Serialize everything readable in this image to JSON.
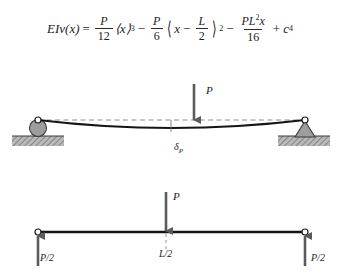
{
  "figure": {
    "colors": {
      "line": "#1c1c1c",
      "dashed_reference": "#8a8a8a",
      "support_fill": "#9a9a9a",
      "ground_hatch": "#8d8d8d",
      "arrow": "#555555",
      "background": "#ffffff"
    }
  },
  "equation": {
    "lhs": "EIv(x)",
    "equals": "=",
    "term1": {
      "numerator": "P",
      "denominator": "12",
      "bracket": "⟨x⟩",
      "exponent": "3"
    },
    "op1": "−",
    "term2": {
      "numerator": "P",
      "denominator": "6",
      "bracket_open": "⟨",
      "inner_var": "x",
      "inner_op": "−",
      "inner_num": "L",
      "inner_den": "2",
      "bracket_close": "⟩",
      "exponent": "2"
    },
    "op2": "−",
    "term3": {
      "numerator": "PL",
      "numerator_exp": "2",
      "numerator_var": "x",
      "denominator": "16"
    },
    "op3": "+",
    "term4": {
      "symbol": "c",
      "subscript": "4"
    },
    "plain_text": "EIv(x) = P/12 ⟨x⟩³ − P/6 ⟨x − L/2⟩² − PL²x/16 + c₄"
  },
  "deflected_beam": {
    "caption": "Deflected shape of simply supported beam",
    "load_label": "P",
    "deflection_symbol": "δ",
    "deflection_subscript": "P",
    "left_support": "roller",
    "right_support": "pin",
    "reference_line_style": "dashed",
    "load_position": "midspan"
  },
  "free_body_diagram": {
    "caption": "Free-body diagram with support reactions",
    "load_label": "P",
    "span_label": "L/2",
    "reaction_left": "P/2",
    "reaction_right": "P/2",
    "left_end": "pin-circle",
    "right_end": "pin-circle"
  }
}
